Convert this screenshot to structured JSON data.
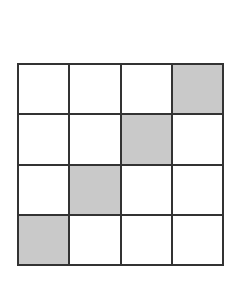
{
  "diagram": {
    "type": "grid",
    "rows": 4,
    "cols": 4,
    "colors": {
      "border": "#333333",
      "empty": "#ffffff",
      "shaded": "#c9c9c9"
    },
    "cells": [
      [
        0,
        0,
        0,
        1
      ],
      [
        0,
        0,
        1,
        0
      ],
      [
        0,
        1,
        0,
        0
      ],
      [
        1,
        0,
        0,
        0
      ]
    ]
  }
}
